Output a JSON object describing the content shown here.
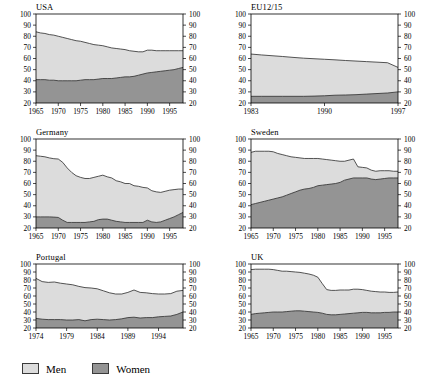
{
  "figure": {
    "legend": {
      "items": [
        {
          "label": "Men",
          "color": "#dcdcdc"
        },
        {
          "label": "Women",
          "color": "#949494"
        }
      ]
    }
  },
  "chart_data": [
    {
      "type": "area",
      "title": "USA",
      "stacked": true,
      "xlabel": "",
      "ylabel": "",
      "ylim": [
        20,
        100
      ],
      "yticks": [
        20,
        30,
        40,
        50,
        60,
        70,
        80,
        90,
        100
      ],
      "xlim": [
        1965,
        1998
      ],
      "xticks": [
        1965,
        1970,
        1975,
        1980,
        1985,
        1990,
        1995
      ],
      "grid": false,
      "dual_y_axis": true,
      "x": [
        1965,
        1966,
        1967,
        1968,
        1969,
        1970,
        1971,
        1972,
        1973,
        1974,
        1975,
        1976,
        1977,
        1978,
        1979,
        1980,
        1981,
        1982,
        1983,
        1984,
        1985,
        1986,
        1987,
        1988,
        1989,
        1990,
        1991,
        1992,
        1993,
        1994,
        1995,
        1996,
        1997,
        1998
      ],
      "series": [
        {
          "name": "Women",
          "values": [
            41,
            41,
            41,
            40.5,
            40.5,
            40,
            40,
            40,
            40,
            40,
            40.5,
            41,
            41,
            41,
            41.5,
            42,
            42,
            42,
            42.5,
            43,
            43.5,
            43.5,
            44,
            45,
            46,
            47,
            47.5,
            48,
            48.5,
            49,
            49.5,
            50,
            51,
            52
          ]
        },
        {
          "name": "Men",
          "values": [
            43,
            42,
            41.5,
            41,
            40.5,
            40,
            39,
            38,
            37,
            36,
            35,
            33.5,
            32.5,
            31.5,
            30.5,
            29.5,
            28.5,
            27.5,
            26.5,
            25.5,
            24.5,
            23.5,
            22.5,
            21,
            20,
            20.5,
            20,
            19,
            18.5,
            18,
            17.5,
            17,
            16,
            15
          ]
        }
      ],
      "totals": [
        84,
        83,
        82.5,
        81.5,
        81,
        80,
        79,
        78,
        77,
        76,
        75.5,
        74.5,
        73.5,
        72.5,
        72,
        71.5,
        70.5,
        69.5,
        69,
        68.5,
        68,
        67,
        66.5,
        66,
        66,
        67.5,
        67.5,
        67,
        67,
        67,
        67,
        67,
        67,
        67
      ]
    },
    {
      "type": "area",
      "title": "EU12/15",
      "stacked": true,
      "xlabel": "",
      "ylabel": "",
      "ylim": [
        20,
        100
      ],
      "yticks": [
        20,
        30,
        40,
        50,
        60,
        70,
        80,
        90,
        100
      ],
      "xlim": [
        1983,
        1997
      ],
      "xticks": [
        1983,
        1990,
        1997
      ],
      "grid": false,
      "dual_y_axis": true,
      "x": [
        1983,
        1984,
        1985,
        1986,
        1987,
        1988,
        1989,
        1990,
        1991,
        1992,
        1993,
        1994,
        1995,
        1996,
        1997
      ],
      "series": [
        {
          "name": "Women",
          "values": [
            26,
            26,
            26,
            26,
            26,
            26,
            26.2,
            26.5,
            27,
            27.2,
            27.5,
            28,
            28.5,
            29,
            30
          ]
        },
        {
          "name": "Men",
          "values": [
            38,
            37.2,
            36.5,
            35.8,
            35,
            34.3,
            33.6,
            32.8,
            31.8,
            31,
            30.2,
            29.2,
            28.2,
            27.2,
            22
          ]
        }
      ],
      "totals": [
        64,
        63.2,
        62.5,
        61.8,
        61,
        60.3,
        59.8,
        59.3,
        58.8,
        58.2,
        57.7,
        57.2,
        56.7,
        56.2,
        52
      ]
    },
    {
      "type": "area",
      "title": "Germany",
      "stacked": true,
      "xlabel": "",
      "ylabel": "",
      "ylim": [
        20,
        100
      ],
      "yticks": [
        20,
        30,
        40,
        50,
        60,
        70,
        80,
        90,
        100
      ],
      "xlim": [
        1965,
        1998
      ],
      "xticks": [
        1965,
        1970,
        1975,
        1980,
        1985,
        1990,
        1995
      ],
      "grid": false,
      "dual_y_axis": true,
      "x": [
        1965,
        1966,
        1967,
        1968,
        1969,
        1970,
        1971,
        1972,
        1973,
        1974,
        1975,
        1976,
        1977,
        1978,
        1979,
        1980,
        1981,
        1982,
        1983,
        1984,
        1985,
        1986,
        1987,
        1988,
        1989,
        1990,
        1991,
        1992,
        1993,
        1994,
        1995,
        1996,
        1997,
        1998
      ],
      "series": [
        {
          "name": "Women",
          "values": [
            30,
            30,
            30,
            30,
            29.8,
            29.5,
            27,
            25,
            25,
            25,
            25,
            25,
            25.5,
            26,
            27.5,
            28,
            28,
            27,
            26,
            25.5,
            25,
            25,
            25,
            25,
            25,
            27,
            25.5,
            25,
            25.5,
            27,
            28.5,
            30,
            32,
            34
          ]
        },
        {
          "name": "Men",
          "values": [
            55,
            54.5,
            54,
            53,
            52.5,
            52.5,
            52,
            49,
            45,
            42,
            40.5,
            39.5,
            39,
            39.5,
            39,
            39.5,
            38,
            38,
            36.5,
            36,
            35,
            35,
            33,
            32.5,
            31.5,
            29,
            28,
            27.5,
            26.5,
            26,
            25.5,
            24.5,
            23,
            21
          ]
        }
      ],
      "totals": [
        85,
        84.5,
        84,
        83,
        82.3,
        82,
        79,
        74,
        70,
        67,
        65.5,
        64.5,
        64.5,
        65.5,
        66.5,
        67.5,
        66,
        65,
        62.5,
        61.5,
        60,
        60,
        58,
        57.5,
        56.5,
        56,
        53.5,
        52.5,
        52,
        53,
        54,
        54.5,
        55,
        55
      ]
    },
    {
      "type": "area",
      "title": "Sweden",
      "stacked": true,
      "xlabel": "",
      "ylabel": "",
      "ylim": [
        20,
        100
      ],
      "yticks": [
        20,
        30,
        40,
        50,
        60,
        70,
        80,
        90,
        100
      ],
      "xlim": [
        1965,
        1998
      ],
      "xticks": [
        1965,
        1970,
        1975,
        1980,
        1985,
        1990,
        1995
      ],
      "grid": false,
      "dual_y_axis": true,
      "x": [
        1965,
        1966,
        1967,
        1968,
        1969,
        1970,
        1971,
        1972,
        1973,
        1974,
        1975,
        1976,
        1977,
        1978,
        1979,
        1980,
        1981,
        1982,
        1983,
        1984,
        1985,
        1986,
        1987,
        1988,
        1989,
        1990,
        1991,
        1992,
        1993,
        1994,
        1995,
        1996,
        1997,
        1998
      ],
      "series": [
        {
          "name": "Women",
          "values": [
            41,
            42,
            43,
            44,
            45,
            46,
            47,
            48,
            49.5,
            51,
            52.5,
            54,
            55,
            55.5,
            56.5,
            58,
            58.5,
            59,
            59.5,
            60,
            61,
            63,
            64,
            65,
            65,
            65,
            65,
            64,
            63.5,
            64,
            64.5,
            65,
            65,
            65
          ]
        },
        {
          "name": "Men",
          "values": [
            47,
            47,
            46,
            45,
            44,
            42.5,
            40,
            38,
            35.5,
            33,
            31,
            29,
            27.5,
            27,
            26,
            24.5,
            23.5,
            22.5,
            21.5,
            20.5,
            19,
            17,
            17,
            17,
            10,
            9.5,
            9,
            8,
            7.5,
            7.5,
            7,
            6.5,
            6,
            6
          ]
        }
      ],
      "totals": [
        88,
        89,
        89,
        89,
        89,
        88.5,
        87,
        86,
        85,
        84,
        83.5,
        83,
        82.5,
        82.5,
        82.5,
        82.5,
        82,
        81.5,
        81,
        80.5,
        80,
        80,
        81,
        82,
        75,
        74.5,
        74,
        72,
        71,
        71.5,
        71.5,
        71.5,
        71,
        71
      ]
    },
    {
      "type": "area",
      "title": "Portugal",
      "stacked": true,
      "xlabel": "",
      "ylabel": "",
      "ylim": [
        20,
        100
      ],
      "yticks": [
        20,
        30,
        40,
        50,
        60,
        70,
        80,
        90,
        100
      ],
      "xlim": [
        1974,
        1998
      ],
      "xticks": [
        1974,
        1979,
        1984,
        1989,
        1994
      ],
      "grid": false,
      "dual_y_axis": true,
      "x": [
        1974,
        1975,
        1976,
        1977,
        1978,
        1979,
        1980,
        1981,
        1982,
        1983,
        1984,
        1985,
        1986,
        1987,
        1988,
        1989,
        1990,
        1991,
        1992,
        1993,
        1994,
        1995,
        1996,
        1997,
        1998
      ],
      "series": [
        {
          "name": "Women",
          "values": [
            32,
            31,
            30.5,
            30.5,
            30.5,
            30,
            30,
            30.5,
            29,
            30.5,
            31,
            30.5,
            30,
            30.5,
            31.5,
            33,
            33.5,
            32.5,
            33,
            33,
            34,
            34.5,
            35,
            37,
            40
          ]
        },
        {
          "name": "Men",
          "values": [
            50,
            47,
            46.5,
            47,
            45.5,
            45,
            44,
            41.5,
            41.5,
            39.5,
            38,
            36,
            34,
            32,
            31,
            31.5,
            34,
            32,
            31,
            30,
            28.5,
            28,
            28,
            29,
            27
          ]
        }
      ],
      "totals": [
        82,
        78,
        77,
        77.5,
        76,
        75,
        74,
        72,
        70.5,
        70,
        69,
        66.5,
        64,
        62.5,
        62.5,
        64.5,
        67.5,
        64.5,
        64,
        63,
        62.5,
        62.5,
        63,
        66,
        67
      ]
    },
    {
      "type": "area",
      "title": "UK",
      "stacked": true,
      "xlabel": "",
      "ylabel": "",
      "ylim": [
        20,
        100
      ],
      "yticks": [
        20,
        30,
        40,
        50,
        60,
        70,
        80,
        90,
        100
      ],
      "xlim": [
        1965,
        1998
      ],
      "xticks": [
        1965,
        1970,
        1975,
        1980,
        1985,
        1990,
        1995
      ],
      "grid": false,
      "dual_y_axis": true,
      "x": [
        1965,
        1966,
        1967,
        1968,
        1969,
        1970,
        1971,
        1972,
        1973,
        1974,
        1975,
        1976,
        1977,
        1978,
        1979,
        1980,
        1981,
        1982,
        1983,
        1984,
        1985,
        1986,
        1987,
        1988,
        1989,
        1990,
        1991,
        1992,
        1993,
        1994,
        1995,
        1996,
        1997,
        1998
      ],
      "series": [
        {
          "name": "Women",
          "values": [
            37,
            38,
            38.5,
            39,
            39.5,
            40,
            40,
            40,
            40.5,
            41,
            41.5,
            41.5,
            41,
            40.5,
            40,
            39.5,
            38.5,
            37,
            36.5,
            36.5,
            37,
            37.5,
            38,
            38.5,
            39,
            39.5,
            39.5,
            39,
            39,
            39,
            39.5,
            39.5,
            40,
            40
          ]
        },
        {
          "name": "Men",
          "values": [
            56,
            55.5,
            55,
            54.5,
            54,
            53,
            52,
            51,
            50.5,
            49.5,
            48.5,
            48,
            47.5,
            47,
            46,
            44,
            37,
            31,
            30.5,
            30.5,
            30.5,
            30,
            29.5,
            30,
            29.5,
            28.5,
            27.5,
            27,
            26.5,
            26,
            25.5,
            25,
            24.5,
            25
          ]
        }
      ],
      "totals": [
        93,
        93.5,
        93.5,
        93.5,
        93.5,
        93,
        92,
        91,
        91,
        90.5,
        90,
        89.5,
        88.5,
        87.5,
        86,
        83.5,
        75.5,
        68,
        67,
        67,
        67.5,
        67.5,
        67.5,
        68.5,
        68.5,
        68,
        67,
        66,
        65.5,
        65,
        65,
        64.5,
        64.5,
        65
      ]
    }
  ]
}
